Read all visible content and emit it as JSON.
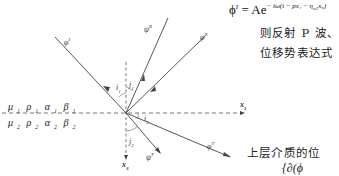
{
  "figure": {
    "rays": [
      {
        "name": "phi-I",
        "label": "φ",
        "sup": "I",
        "role": "incident P wave"
      },
      {
        "name": "psi-R",
        "label": "ψ",
        "sup": "R",
        "role": "reflected S wave"
      },
      {
        "name": "phi-R",
        "label": "φ",
        "sup": "R",
        "role": "reflected P wave"
      },
      {
        "name": "phi-T",
        "label": "φ",
        "sup": "T",
        "role": "transmitted P wave"
      },
      {
        "name": "psi-T",
        "label": "ψ",
        "sup": "T",
        "role": "transmitted S wave"
      }
    ],
    "angles": [
      {
        "label": "i",
        "sub": "1"
      },
      {
        "label": "j",
        "sub": "1"
      },
      {
        "label": "i",
        "sub": "2"
      },
      {
        "label": "j",
        "sub": "2"
      }
    ],
    "axes": {
      "x1": {
        "label": "x",
        "sub": "1"
      },
      "x3": {
        "label": "x",
        "sub": "3"
      }
    },
    "upper_medium": [
      {
        "sym": "μ",
        "sub": "1"
      },
      {
        "sym": "ρ",
        "sub": "1"
      },
      {
        "sym": "α",
        "sub": "1"
      },
      {
        "sym": "β",
        "sub": "1"
      }
    ],
    "lower_medium": [
      {
        "sym": "μ",
        "sub": "2"
      },
      {
        "sym": "ρ",
        "sub": "2"
      },
      {
        "sym": "α",
        "sub": "2"
      },
      {
        "sym": "β",
        "sub": "2"
      }
    ]
  },
  "text": {
    "formula_lhs": "ϕ",
    "formula_lhs_sup": "I",
    "formula_eq": " = Ae",
    "formula_exponent": "− iω(t − px₁ − η",
    "formula_exponent_sub": "α1",
    "formula_exponent_tail": "x₃)",
    "line1": "则反射 P 波、",
    "line2": "位移势表达式",
    "line3": "上层介质的位",
    "line4": "{∂(ϕ"
  }
}
